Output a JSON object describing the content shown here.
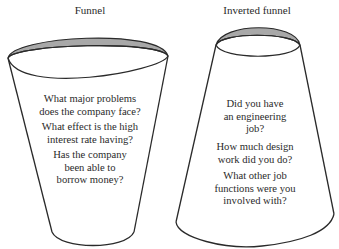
{
  "funnel": {
    "title": "Funnel",
    "questions": [
      "What major problems\ndoes the company face?",
      "What effect is the high\ninterest rate having?",
      "Has the company\nbeen able to\nborrow money?"
    ]
  },
  "inverted_funnel": {
    "title": "Inverted funnel",
    "questions": [
      "Did you have\nan engineering\njob?",
      "How much design\nwork did you do?",
      "What other job\nfunctions were you\ninvolved with?"
    ]
  },
  "colors": {
    "outline": "#2a2a2a",
    "rim_fill": "#a8a8a8",
    "background": "#ffffff"
  }
}
